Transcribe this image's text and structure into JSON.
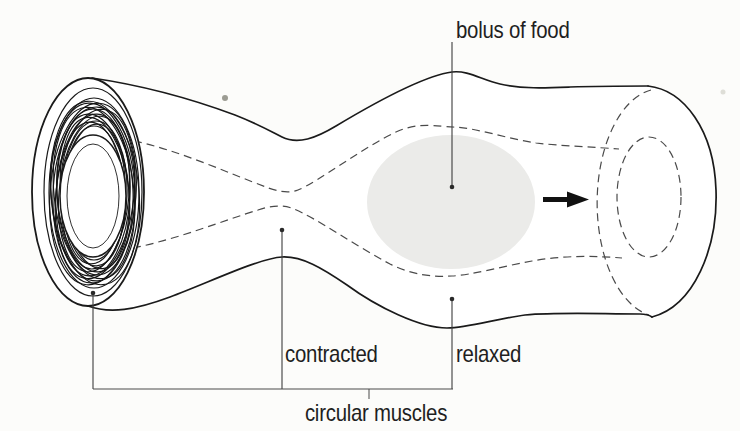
{
  "figure": {
    "labels": {
      "bolus_of_food": "bolus of food",
      "contracted": "contracted",
      "relaxed": "relaxed",
      "circular_muscles": "circular muscles"
    },
    "colors": {
      "background": "#fcfcfa",
      "outline": "#1a1a1a",
      "dashed_line": "#4a4a4a",
      "bolus_fill": "#ebebe9",
      "text": "#1f1f1f",
      "arrow": "#111111"
    },
    "icons": {
      "flow_arrow": "right-arrow"
    }
  }
}
